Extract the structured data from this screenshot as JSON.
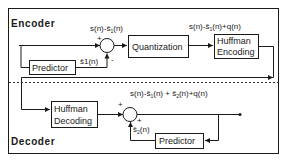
{
  "diagram": {
    "type": "block-diagram",
    "sections": {
      "encoder": {
        "label": "Encoder"
      },
      "decoder": {
        "label": "Decoder"
      }
    },
    "blocks": {
      "enc_predictor": {
        "label": "Predictor"
      },
      "quantization": {
        "label": "Quantization"
      },
      "huffman_encoding": {
        "line1": "Huffman",
        "line2": "Encoding"
      },
      "huffman_decoding": {
        "line1": "Huffman",
        "line2": "Decoding"
      },
      "dec_predictor": {
        "label": "Predictor"
      }
    },
    "signals": {
      "enc_error": {
        "base": "s(n)-ŝ",
        "sub": "1",
        "tail": "(n)"
      },
      "enc_prediction": {
        "text": "ŝ1(n)"
      },
      "quantized": {
        "base": "s(n)-ŝ",
        "sub": "1",
        "tail": "(n)+q(n)"
      },
      "dec_output": {
        "p1": "s(n)-ŝ",
        "sub1": "1",
        "p2": "(n) + ŝ",
        "sub2": "2",
        "p3": "(n)+q(n)"
      },
      "dec_prediction": {
        "base": "ŝ",
        "sub": "2",
        "tail": "(n)"
      }
    },
    "summers": {
      "encoder": {
        "plus": "+",
        "minus": "-"
      },
      "decoder": {
        "plus_top": "+",
        "plus_side": "+"
      }
    },
    "colors": {
      "line": "#1a1a1a",
      "background": "#ffffff",
      "divider": "#333333"
    }
  }
}
